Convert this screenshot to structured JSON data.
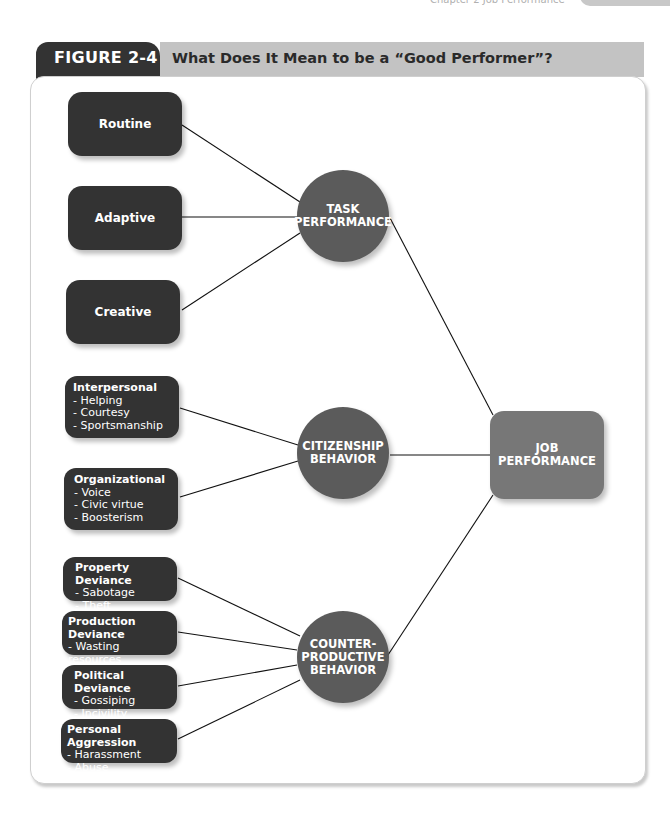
{
  "page": {
    "running_head": "Chapter 2   Job Performance",
    "page_number": "39"
  },
  "figure": {
    "label": "FIGURE 2-4",
    "title": "What Does It Mean to be a “Good Performer”?"
  },
  "diagram": {
    "task_facets": [
      "Routine",
      "Adaptive",
      "Creative"
    ],
    "citizenship_facets": [
      {
        "title": "Interpersonal",
        "items": [
          "- Helping",
          "- Courtesy",
          "- Sportsmanship"
        ]
      },
      {
        "title": "Organizational",
        "items": [
          "- Voice",
          "- Civic virtue",
          "- Boosterism"
        ]
      }
    ],
    "cwb_facets": [
      {
        "title": "Property Deviance",
        "items": [
          "- Sabotage",
          "- Theft"
        ]
      },
      {
        "title": "Production Deviance",
        "items": [
          "- Wasting resources",
          "- Substance abuse"
        ]
      },
      {
        "title": "Political Deviance",
        "items": [
          "- Gossiping",
          "- Incivility"
        ]
      },
      {
        "title": "Personal Aggression",
        "items": [
          "- Harassment",
          "- Abuse"
        ]
      }
    ],
    "nodes": {
      "task": [
        "TASK",
        "PERFORMANCE"
      ],
      "citizenship": [
        "CITIZENSHIP",
        "BEHAVIOR"
      ],
      "cwb": [
        "COUNTER-",
        "PRODUCTIVE",
        "BEHAVIOR"
      ],
      "job": [
        "JOB",
        "PERFORMANCE"
      ]
    },
    "colors": {
      "facet_box": "#333333",
      "dimension_circle": "#5b5b5b",
      "job_box": "#777777",
      "title_bar": "#c3c3c3"
    }
  }
}
